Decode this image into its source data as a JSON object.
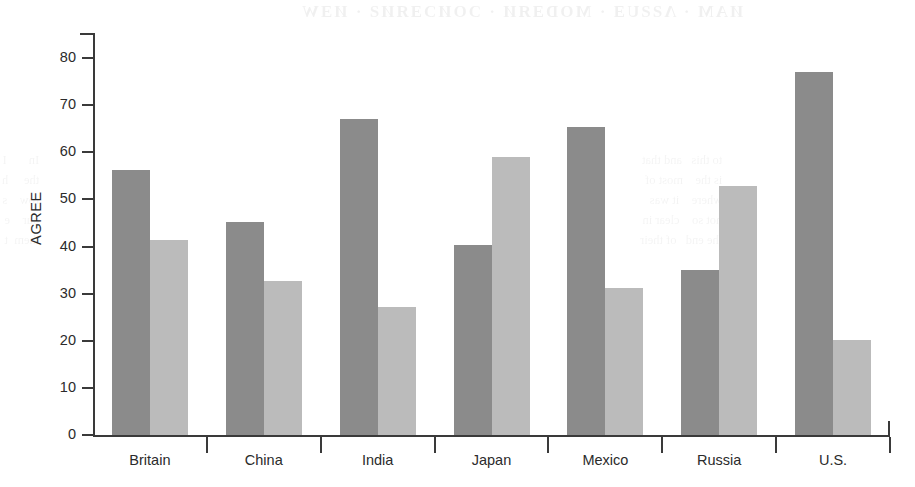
{
  "chart_data": {
    "type": "bar",
    "title": "",
    "subtitle": "",
    "xlabel": "",
    "ylabel": "AGREE",
    "ylim": [
      0,
      85
    ],
    "yticks": [
      0,
      10,
      20,
      30,
      40,
      50,
      60,
      70,
      80
    ],
    "ytick_labels": [
      "0",
      "10",
      "20",
      "30",
      "40",
      "50",
      "60",
      "70",
      "80"
    ],
    "grid": false,
    "legend_position": "none",
    "categories": [
      "Britain",
      "China",
      "India",
      "Japan",
      "Mexico",
      "Russia",
      "U.S."
    ],
    "series": [
      {
        "name": "series-1",
        "color": "#8b8b8b",
        "values": [
          56.3,
          45.1,
          67.1,
          40.3,
          65.3,
          35.1,
          77.0
        ]
      },
      {
        "name": "series-2",
        "color": "#bbbbbb",
        "values": [
          41.4,
          32.7,
          27.2,
          58.9,
          31.2,
          52.9,
          20.1
        ]
      }
    ]
  },
  "axes": {
    "y_axis_label": "AGREE",
    "y_tick_values": [
      "0",
      "10",
      "20",
      "30",
      "40",
      "50",
      "60",
      "70",
      "80"
    ],
    "x_tick_values": [
      "Britain",
      "China",
      "India",
      "Japan",
      "Mexico",
      "Russia",
      "U.S."
    ]
  },
  "colors": {
    "series_dark": "#8b8b8b",
    "series_light": "#bbbbbb",
    "axis": "#3a3a3a",
    "text": "#2b2b2b",
    "background": "#ffffff"
  },
  "artifacts": {
    "bleed_top": "ИАΜ  ·  ΛƧƧUƎ  ·  ΜODƎЯИ  ·  ƆOИƆƎЯИƧ  ·  ИƎW",
    "bleed_side_left": "In       I\nthe     h\nrow    s\nour    e\nthem  t",
    "bleed_side_right": "to this   and that\nis the    most of\nwhere    it was\nnot so    clear in\nthe end   of their"
  }
}
